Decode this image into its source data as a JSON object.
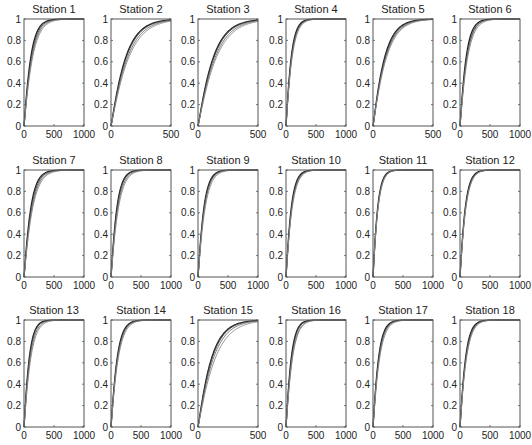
{
  "figure": {
    "rows": 3,
    "cols": 6,
    "layout": {
      "col_left": [
        24,
        111,
        198,
        286,
        373,
        460
      ],
      "row_top": [
        19,
        170,
        320
      ],
      "plot_width": 60,
      "plot_height": 107
    },
    "style": {
      "axis_color": "#555555",
      "curve_colors": [
        "#222222",
        "#444444",
        "#666666",
        "#888888"
      ],
      "title_font_size": 11,
      "tick_font_size": 10
    }
  },
  "chart_data": {
    "type": "line",
    "ylim": [
      0,
      1
    ],
    "yticks": [
      0,
      0.2,
      0.4,
      0.6,
      0.8,
      1
    ],
    "ytick_labels": [
      "0",
      "0.2",
      "0.4",
      "0.6",
      "0.8",
      "1"
    ],
    "grid": false,
    "legend": null,
    "panels": [
      {
        "title": "Station 1",
        "xlim": [
          0,
          1000
        ],
        "xticks": [
          0,
          500,
          1000
        ],
        "xtick_labels": [
          "0",
          "500",
          "1000"
        ],
        "scales": [
          110,
          120,
          130,
          140
        ]
      },
      {
        "title": "Station 2",
        "xlim": [
          0,
          500
        ],
        "xticks": [
          0,
          500
        ],
        "xtick_labels": [
          "0",
          "500"
        ],
        "scales": [
          120,
          125,
          135,
          145
        ]
      },
      {
        "title": "Station 3",
        "xlim": [
          0,
          500
        ],
        "xticks": [
          0,
          500
        ],
        "xtick_labels": [
          "0",
          "500"
        ],
        "scales": [
          125,
          130,
          140,
          150
        ]
      },
      {
        "title": "Station 4",
        "xlim": [
          0,
          1000
        ],
        "xticks": [
          0,
          500,
          1000
        ],
        "xtick_labels": [
          "0",
          "500",
          "1000"
        ],
        "scales": [
          85,
          90,
          95,
          100
        ]
      },
      {
        "title": "Station 5",
        "xlim": [
          0,
          500
        ],
        "xticks": [
          0,
          500
        ],
        "xtick_labels": [
          "0",
          "500"
        ],
        "scales": [
          95,
          100,
          105,
          110
        ]
      },
      {
        "title": "Station 6",
        "xlim": [
          0,
          1000
        ],
        "xticks": [
          0,
          500,
          1000
        ],
        "xtick_labels": [
          "0",
          "500",
          "1000"
        ],
        "scales": [
          100,
          110,
          115,
          125
        ]
      },
      {
        "title": "Station 7",
        "xlim": [
          0,
          1000
        ],
        "xticks": [
          0,
          500,
          1000
        ],
        "xtick_labels": [
          "0",
          "500",
          "1000"
        ],
        "scales": [
          110,
          120,
          130,
          140
        ]
      },
      {
        "title": "Station 8",
        "xlim": [
          0,
          1000
        ],
        "xticks": [
          0,
          500,
          1000
        ],
        "xtick_labels": [
          "0",
          "500",
          "1000"
        ],
        "scales": [
          95,
          100,
          110,
          120
        ]
      },
      {
        "title": "Station 9",
        "xlim": [
          0,
          1000
        ],
        "xticks": [
          0,
          500,
          1000
        ],
        "xtick_labels": [
          "0",
          "500",
          "1000"
        ],
        "scales": [
          95,
          100,
          105,
          115
        ]
      },
      {
        "title": "Station 10",
        "xlim": [
          0,
          1000
        ],
        "xticks": [
          0,
          500,
          1000
        ],
        "xtick_labels": [
          "0",
          "500",
          "1000"
        ],
        "scales": [
          85,
          90,
          95,
          100
        ]
      },
      {
        "title": "Station 11",
        "xlim": [
          0,
          1000
        ],
        "xticks": [
          0,
          500,
          1000
        ],
        "xtick_labels": [
          "0",
          "500",
          "1000"
        ],
        "scales": [
          75,
          78,
          80,
          83
        ]
      },
      {
        "title": "Station 12",
        "xlim": [
          0,
          1000
        ],
        "xticks": [
          0,
          500,
          1000
        ],
        "xtick_labels": [
          "0",
          "500",
          "1000"
        ],
        "scales": [
          85,
          88,
          92,
          95
        ]
      },
      {
        "title": "Station 13",
        "xlim": [
          0,
          1000
        ],
        "xticks": [
          0,
          500,
          1000
        ],
        "xtick_labels": [
          "0",
          "500",
          "1000"
        ],
        "scales": [
          85,
          90,
          100,
          110
        ]
      },
      {
        "title": "Station 14",
        "xlim": [
          0,
          1000
        ],
        "xticks": [
          0,
          500,
          1000
        ],
        "xtick_labels": [
          "0",
          "500",
          "1000"
        ],
        "scales": [
          100,
          105,
          110,
          118
        ]
      },
      {
        "title": "Station 15",
        "xlim": [
          0,
          500
        ],
        "xticks": [
          0,
          500
        ],
        "xtick_labels": [
          "0",
          "500"
        ],
        "scales": [
          110,
          115,
          125,
          140
        ]
      },
      {
        "title": "Station 16",
        "xlim": [
          0,
          1000
        ],
        "xticks": [
          0,
          500,
          1000
        ],
        "xtick_labels": [
          "0",
          "500",
          "1000"
        ],
        "scales": [
          85,
          90,
          100,
          105
        ]
      },
      {
        "title": "Station 17",
        "xlim": [
          0,
          1000
        ],
        "xticks": [
          0,
          500,
          1000
        ],
        "xtick_labels": [
          "0",
          "500",
          "1000"
        ],
        "scales": [
          90,
          95,
          100,
          108
        ]
      },
      {
        "title": "Station 18",
        "xlim": [
          0,
          1000
        ],
        "xticks": [
          0,
          500,
          1000
        ],
        "xtick_labels": [
          "0",
          "500",
          "1000"
        ],
        "scales": [
          90,
          95,
          100,
          105
        ]
      }
    ]
  }
}
